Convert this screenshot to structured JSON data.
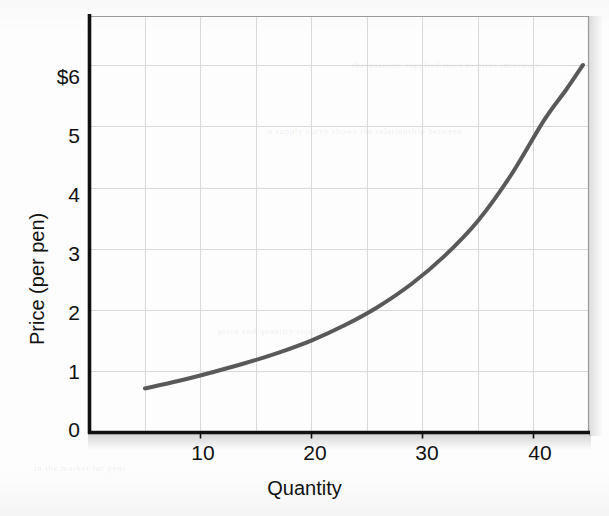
{
  "chart_data": {
    "type": "line",
    "title": "",
    "xlabel": "Quantity",
    "ylabel": "Price (per pen)",
    "xlim": [
      0,
      45
    ],
    "ylim": [
      0,
      6.8
    ],
    "grid": true,
    "legend": null,
    "x_ticks": [
      10,
      20,
      30,
      40
    ],
    "x_tick_labels": [
      "10",
      "20",
      "30",
      "40"
    ],
    "y_ticks": [
      0,
      1,
      2,
      3,
      4,
      5,
      6
    ],
    "y_tick_labels": [
      "0",
      "1",
      "2",
      "3",
      "4",
      "5",
      "$6"
    ],
    "x_gridlines": [
      5,
      10,
      15,
      20,
      25,
      30,
      35,
      40
    ],
    "y_gridlines": [
      1,
      2,
      3,
      4,
      5,
      6
    ],
    "series": [
      {
        "name": "Supply",
        "color": "#595959",
        "line_width": 4,
        "x": [
          5,
          8,
          11,
          14,
          17,
          20,
          23,
          26,
          29,
          32,
          35,
          38,
          41,
          43,
          44.5
        ],
        "y": [
          0.72,
          0.84,
          0.98,
          1.13,
          1.3,
          1.5,
          1.75,
          2.05,
          2.42,
          2.88,
          3.45,
          4.2,
          5.1,
          5.6,
          6.0
        ]
      }
    ]
  },
  "axes": {
    "x_title": "Quantity",
    "y_title": "Price (per pen)",
    "x_tick_labels": [
      "10",
      "20",
      "30",
      "40"
    ],
    "y_tick_labels": [
      "$6",
      "5",
      "4",
      "3",
      "2",
      "1",
      "0"
    ]
  },
  "colors": {
    "curve": "#595959",
    "axis": "#111111",
    "grid": "#d8d8d8",
    "background": "#fdfdfd"
  },
  "bleed_text": {
    "line1": "the quantity supplied rises as price increases",
    "line2": "a supply curve shows the relationship between",
    "line3": "price and quantity supplied",
    "line4": "in the market for pens"
  }
}
